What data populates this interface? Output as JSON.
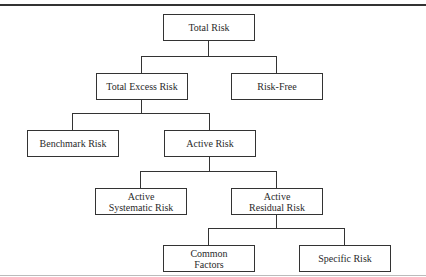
{
  "diagram": {
    "type": "hierarchy-tree",
    "nodes": [
      {
        "id": "total-risk",
        "lines": [
          "Total Risk"
        ],
        "parent": null
      },
      {
        "id": "total-excess-risk",
        "lines": [
          "Total Excess Risk"
        ],
        "parent": "total-risk"
      },
      {
        "id": "risk-free",
        "lines": [
          "Risk-Free"
        ],
        "parent": "total-risk"
      },
      {
        "id": "benchmark-risk",
        "lines": [
          "Benchmark Risk"
        ],
        "parent": "total-excess-risk"
      },
      {
        "id": "active-risk",
        "lines": [
          "Active Risk"
        ],
        "parent": "total-excess-risk"
      },
      {
        "id": "active-systematic-risk",
        "lines": [
          "Active",
          "Systematic Risk"
        ],
        "parent": "active-risk"
      },
      {
        "id": "active-residual-risk",
        "lines": [
          "Active",
          "Residual Risk"
        ],
        "parent": "active-risk"
      },
      {
        "id": "common-factors",
        "lines": [
          "Common",
          "Factors"
        ],
        "parent": "active-residual-risk"
      },
      {
        "id": "specific-risk",
        "lines": [
          "Specific Risk"
        ],
        "parent": "active-residual-risk"
      }
    ]
  }
}
